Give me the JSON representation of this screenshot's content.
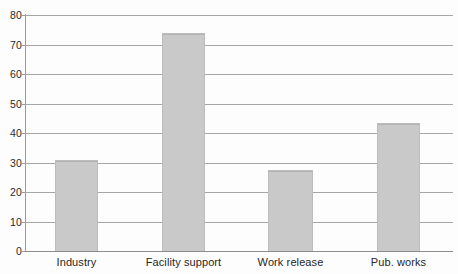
{
  "chart_data": {
    "type": "bar",
    "title": "",
    "subtitle": "",
    "xlabel": "",
    "ylabel": "",
    "categories": [
      "Industry",
      "Facility support",
      "Work release",
      "Pub. works"
    ],
    "values": [
      30.8,
      74,
      27.5,
      43.5
    ],
    "ylim": [
      0,
      80
    ],
    "yticks": [
      0,
      10,
      20,
      30,
      40,
      50,
      60,
      70,
      80
    ],
    "ytick_labels": [
      "0",
      "10",
      "20",
      "30",
      "40",
      "50",
      "60",
      "70",
      "80"
    ],
    "grid": true,
    "grid_axis": "y",
    "legend": false,
    "legend_position": "none",
    "bar_color": "#c9c9c9",
    "bar_edge_color": "#bcbcbc",
    "gridline_color": "#a6a6a6",
    "axis_color": "#9a9a9a",
    "background_color": "#fdfdfd",
    "text_color": "#272727"
  }
}
